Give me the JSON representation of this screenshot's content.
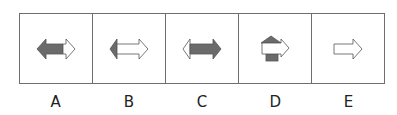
{
  "options": [
    {
      "label": "A",
      "figure": "double-arrow-left-dark-right-light"
    },
    {
      "label": "B",
      "figure": "double-arrow-left-dark-tip-rest-light"
    },
    {
      "label": "C",
      "figure": "double-arrow-left-light-tip-rest-dark"
    },
    {
      "label": "D",
      "figure": "light-right-arrow-over-dark-up-arrow"
    },
    {
      "label": "E",
      "figure": "light-right-arrow"
    }
  ],
  "colors": {
    "dark": "#6b6b6b",
    "light": "#ffffff",
    "stroke": "#555555",
    "border": "#6e6e6e"
  }
}
